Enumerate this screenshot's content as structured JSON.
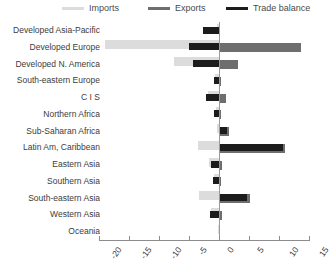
{
  "legend": {
    "items": [
      {
        "label": "Imports",
        "color": "#dcdcdc",
        "key": "imports"
      },
      {
        "label": "Exports",
        "color": "#6e6e6e",
        "key": "exports"
      },
      {
        "label": "Trade balance",
        "color": "#1c1c1c",
        "key": "balance"
      }
    ]
  },
  "axis": {
    "tick_labels": [
      "-20",
      "-15",
      "-10",
      "-5",
      "0",
      "5",
      "10",
      "15"
    ]
  },
  "chart_data": {
    "type": "bar",
    "orientation": "horizontal",
    "title": "",
    "xlabel": "",
    "ylabel": "",
    "xlim": [
      -20,
      15
    ],
    "ticks": [
      -20,
      -15,
      -10,
      -5,
      0,
      5,
      10,
      15
    ],
    "grid": false,
    "legend_position": "top",
    "categories": [
      "Developed Asia-Pacific",
      "Developed Europe",
      "Developed N. America",
      "South-eastern Europe",
      "C I S",
      "Northern Africa",
      "Sub-Saharan Africa",
      "Latin Am, Caribbean",
      "Eastern Asia",
      "Southern Asia",
      "South-eastern Asia",
      "Western Asia",
      "Oceania"
    ],
    "series": [
      {
        "name": "Imports",
        "color": "#dcdcdc",
        "values": [
          -0.4,
          -19.0,
          -7.5,
          -0.6,
          -1.8,
          -0.5,
          -0.3,
          -3.5,
          -1.6,
          -0.8,
          -3.4,
          -1.3,
          -0.1
        ]
      },
      {
        "name": "Exports",
        "color": "#6e6e6e",
        "values": [
          0.2,
          13.6,
          3.2,
          0.3,
          1.2,
          0.4,
          1.7,
          11.0,
          0.5,
          0.4,
          5.2,
          0.5,
          0.1
        ]
      },
      {
        "name": "Trade balance",
        "color": "#1c1c1c",
        "values": [
          -2.6,
          -5.0,
          -4.3,
          -0.8,
          -2.1,
          -0.9,
          1.4,
          10.6,
          -1.3,
          -1.0,
          4.6,
          -1.5,
          0.1
        ]
      }
    ]
  }
}
